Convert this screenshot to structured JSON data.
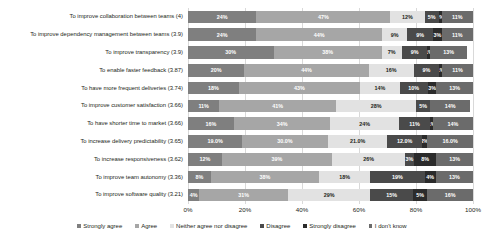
{
  "chart_data": {
    "type": "bar",
    "orientation": "horizontal",
    "stacked": true,
    "stack_mode": "percent",
    "title": "",
    "xlabel": "",
    "ylabel": "",
    "xlim": [
      0,
      100
    ],
    "xticks": [
      "0%",
      "20%",
      "40%",
      "60%",
      "80%",
      "100%"
    ],
    "grid": true,
    "legend_position": "bottom",
    "legend": [
      "Strongly agree",
      "Agree",
      "Neither agree nor disagree",
      "Disagree",
      "Strongly disagree",
      "I don't know"
    ],
    "colors": [
      "#7f7f7f",
      "#a6a6a6",
      "#e2e2e2",
      "#4a4a4a",
      "#2b2b2b",
      "#6b6b6b"
    ],
    "categories": [
      "To improve collaboration between teams (4)",
      "To improve dependency management between teams (3.9)",
      "To improve transparency (3.9)",
      "To enable faster feedback (3.87)",
      "To have more frequent deliveries (3.74)",
      "To improve customer satisfaction (3.66)",
      "To have shorter time to market (3.66)",
      "To increase delivery predictability (3.65)",
      "To increase responsiveness (3.62)",
      "To improve team autonomy (3.36)",
      "To improve software quality (3.21)"
    ],
    "series": [
      {
        "name": "Strongly agree",
        "values": [
          24,
          24,
          30,
          20,
          18,
          11,
          16,
          19,
          12,
          8,
          4
        ]
      },
      {
        "name": "Agree",
        "values": [
          47,
          44,
          38,
          44,
          43,
          41,
          34,
          30,
          39,
          38,
          31
        ]
      },
      {
        "name": "Neither agree nor disagree",
        "values": [
          12,
          9,
          7,
          16,
          14,
          28,
          24,
          21,
          26,
          18,
          29
        ]
      },
      {
        "name": "Disagree",
        "values": [
          5,
          9,
          9,
          9,
          10,
          5,
          11,
          12,
          3,
          19,
          15
        ]
      },
      {
        "name": "Strongly disagree",
        "values": [
          1,
          3,
          1,
          1,
          3,
          0,
          1,
          2,
          8,
          4,
          5
        ]
      },
      {
        "name": "I don't know",
        "values": [
          11,
          11,
          13,
          11,
          13,
          14,
          14,
          16,
          13,
          13,
          16
        ]
      }
    ],
    "data_labels": [
      [
        "24%",
        "47%",
        "12%",
        "5%",
        "1%",
        "11%"
      ],
      [
        "24%",
        "44%",
        "9%",
        "9%",
        "3%",
        "11%"
      ],
      [
        "30%",
        "38%",
        "7%",
        "9%",
        "1%",
        "13%"
      ],
      [
        "20%",
        "44%",
        "16%",
        "9%",
        "1%",
        "11%"
      ],
      [
        "18%",
        "43%",
        "14%",
        "10%",
        "3%",
        "13%"
      ],
      [
        "11%",
        "41%",
        "28%",
        "5%",
        "0%",
        "14%"
      ],
      [
        "16%",
        "34%",
        "24%",
        "11%",
        "1%",
        "14%"
      ],
      [
        "19.0%",
        "30.0%",
        "21.0%",
        "12.0%",
        "2%",
        "16.0%"
      ],
      [
        "12%",
        "39%",
        "26%",
        "3%",
        "8%",
        "13%"
      ],
      [
        "8%",
        "38%",
        "18%",
        "19%",
        "4%",
        "13%"
      ],
      [
        "4%",
        "31%",
        "29%",
        "15%",
        "5%",
        "16%"
      ]
    ]
  }
}
